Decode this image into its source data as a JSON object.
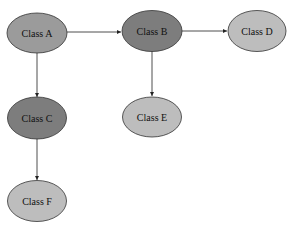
{
  "diagram": {
    "type": "class-graph",
    "colors": {
      "dark_fill": "#7d7d7d",
      "light_fill": "#b9b9b9",
      "stroke": "#333333",
      "edge": "#222222",
      "background": "#ffffff"
    },
    "nodes": [
      {
        "id": "A",
        "label": "Class A",
        "cx": 37,
        "cy": 33,
        "fill": "#9b9b9b"
      },
      {
        "id": "B",
        "label": "Class B",
        "cx": 152,
        "cy": 31,
        "fill": "#7d7d7d"
      },
      {
        "id": "D",
        "label": "Class D",
        "cx": 257,
        "cy": 31,
        "fill": "#bdbdbd"
      },
      {
        "id": "C",
        "label": "Class C",
        "cx": 37,
        "cy": 118,
        "fill": "#7d7d7d"
      },
      {
        "id": "E",
        "label": "Class E",
        "cx": 152,
        "cy": 117,
        "fill": "#bdbdbd"
      },
      {
        "id": "F",
        "label": "Class F",
        "cx": 37,
        "cy": 201,
        "fill": "#bdbdbd"
      }
    ],
    "edges": [
      {
        "from": "A",
        "to": "B"
      },
      {
        "from": "B",
        "to": "D"
      },
      {
        "from": "A",
        "to": "C"
      },
      {
        "from": "B",
        "to": "E"
      },
      {
        "from": "C",
        "to": "F"
      }
    ]
  }
}
